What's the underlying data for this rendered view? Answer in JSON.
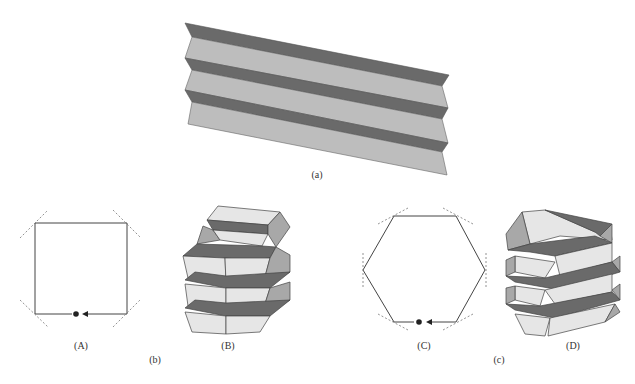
{
  "figure": {
    "panel_a": {
      "label": "(a)",
      "description": "Flat pleated (zig-zag) folded sheet"
    },
    "panel_b": {
      "label": "(b)",
      "sub_a": {
        "label": "(A)",
        "description": "Square cross-section fold path with dashed crease guides and start dot/arrow"
      },
      "sub_b": {
        "label": "(B)",
        "description": "Square folded tube with stacked pleats"
      }
    },
    "panel_c": {
      "label": "(c)",
      "sub_c": {
        "label": "(C)",
        "description": "Hexagonal cross-section fold path with dashed crease guides and start dot/arrow"
      },
      "sub_d": {
        "label": "(D)",
        "description": "Hexagonal twisted folded tube with helical pleats"
      }
    }
  },
  "colors": {
    "light_face": "#bdbdbd",
    "dark_face": "#6a6a6a",
    "pale_face": "#e6e6e6",
    "mid_face": "#a8a8a8",
    "line": "#444444",
    "dashed": "#777777"
  }
}
